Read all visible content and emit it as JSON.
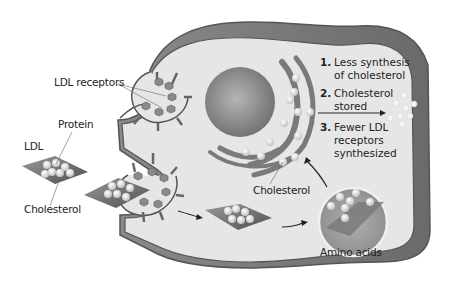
{
  "labels": {
    "ldl_receptors": "LDL receptors",
    "protein": "Protein",
    "ldl": "LDL",
    "cholesterol_left": "Cholesterol",
    "cholesterol_inner": "Cholesterol",
    "amino_acids": "Amino acids"
  },
  "steps": [
    {
      "num": "1.",
      "line1": "Less synthesis",
      "line2": "of cholesterol"
    },
    {
      "num": "2.",
      "line1": "Cholesterol",
      "line2": "stored"
    },
    {
      "num": "3.",
      "line1": "Fewer LDL",
      "line2": "receptors",
      "line3": "synthesized"
    }
  ],
  "colors": {
    "cytoplasm": "#e6e6e6",
    "membrane_outer": "#7a7a7a",
    "membrane_line": "#555555",
    "nucleus": "#8c8c8c",
    "er": "#7d7d7d",
    "particle": "#f2f2f2",
    "ldl_diamond": "#6b6b6b",
    "receptor": "#8a8a8a"
  }
}
